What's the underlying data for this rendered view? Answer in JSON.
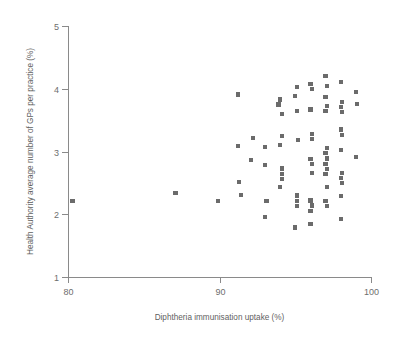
{
  "chart_data": {
    "type": "scatter",
    "title": "",
    "xlabel": "Diphtheria immunisation uptake (%)",
    "ylabel": "Health Authority average number of GPs per practice (%)",
    "xlim": [
      80,
      100
    ],
    "ylim": [
      1,
      5
    ],
    "xticks": [
      80,
      90,
      100
    ],
    "xticklabels": [
      "80",
      "90",
      "100"
    ],
    "yticks": [
      1,
      2,
      3,
      4,
      5
    ],
    "yticklabels": [
      "1",
      "2",
      "3",
      "4",
      "5"
    ],
    "grid": false,
    "legend": null,
    "marker_color": "#6b6b6b",
    "marker_shape": "square",
    "axis_color": "#8a8a8a",
    "points": [
      [
        80.3,
        2.21
      ],
      [
        87.1,
        2.34
      ],
      [
        89.9,
        2.21
      ],
      [
        91.2,
        3.91
      ],
      [
        91.2,
        3.09
      ],
      [
        91.3,
        2.51
      ],
      [
        91.4,
        2.31
      ],
      [
        92.2,
        3.22
      ],
      [
        92.1,
        2.87
      ],
      [
        93.0,
        3.07
      ],
      [
        93.0,
        2.79
      ],
      [
        93.1,
        2.21
      ],
      [
        93.0,
        1.95
      ],
      [
        93.9,
        3.75
      ],
      [
        94.0,
        3.83
      ],
      [
        94.1,
        3.6
      ],
      [
        94.1,
        3.25
      ],
      [
        94.0,
        3.1
      ],
      [
        94.1,
        2.73
      ],
      [
        94.1,
        2.64
      ],
      [
        94.1,
        2.56
      ],
      [
        94.0,
        2.43
      ],
      [
        95.1,
        4.03
      ],
      [
        95.0,
        3.88
      ],
      [
        95.1,
        3.64
      ],
      [
        95.2,
        3.18
      ],
      [
        95.1,
        2.3
      ],
      [
        95.1,
        2.21
      ],
      [
        95.1,
        2.13
      ],
      [
        95.0,
        1.79
      ],
      [
        96.0,
        4.08
      ],
      [
        96.1,
        4.0
      ],
      [
        96.0,
        3.67
      ],
      [
        96.1,
        3.28
      ],
      [
        96.1,
        3.2
      ],
      [
        96.0,
        2.88
      ],
      [
        96.1,
        2.8
      ],
      [
        96.1,
        2.66
      ],
      [
        96.0,
        2.22
      ],
      [
        96.1,
        2.14
      ],
      [
        96.0,
        2.05
      ],
      [
        96.0,
        1.84
      ],
      [
        97.0,
        4.2
      ],
      [
        97.1,
        4.05
      ],
      [
        97.0,
        3.87
      ],
      [
        97.1,
        3.73
      ],
      [
        97.0,
        3.64
      ],
      [
        97.1,
        3.05
      ],
      [
        97.0,
        2.97
      ],
      [
        97.1,
        2.89
      ],
      [
        97.0,
        2.8
      ],
      [
        97.1,
        2.72
      ],
      [
        97.0,
        2.64
      ],
      [
        97.1,
        2.43
      ],
      [
        97.0,
        2.21
      ],
      [
        97.1,
        2.13
      ],
      [
        98.0,
        4.11
      ],
      [
        98.1,
        3.79
      ],
      [
        98.0,
        3.71
      ],
      [
        98.1,
        3.63
      ],
      [
        98.0,
        3.35
      ],
      [
        98.1,
        3.26
      ],
      [
        98.0,
        3.02
      ],
      [
        98.1,
        2.66
      ],
      [
        98.0,
        2.58
      ],
      [
        98.1,
        2.5
      ],
      [
        98.0,
        2.29
      ],
      [
        98.0,
        1.92
      ],
      [
        99.0,
        3.95
      ],
      [
        99.1,
        3.76
      ],
      [
        99.0,
        2.91
      ]
    ]
  }
}
